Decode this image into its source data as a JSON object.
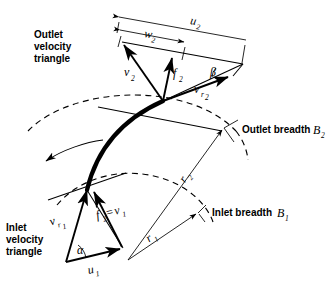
{
  "figure": {
    "kind": "centrifugal-impeller-velocity-triangles",
    "background_color": "#ffffff",
    "ink_color": "#000000"
  },
  "annotations": {
    "outlet_triangle_caption": [
      "Outlet",
      "velocity",
      "triangle"
    ],
    "inlet_triangle_caption": [
      "Inlet",
      "velocity",
      "triangle"
    ],
    "outlet_breadth": "Outlet breadth",
    "outlet_breadth_symbol": "B",
    "outlet_breadth_sub": "2",
    "inlet_breadth": "Inlet breadth",
    "inlet_breadth_symbol": "B",
    "inlet_breadth_sub": "1"
  },
  "vectors": {
    "outlet": [
      {
        "id": "u2",
        "symbol": "u",
        "sub": "2",
        "meaning": "blade-tip-speed"
      },
      {
        "id": "w2",
        "symbol": "w",
        "sub": "2",
        "meaning": "whirl-component"
      },
      {
        "id": "v2",
        "symbol": "v",
        "sub": "2",
        "meaning": "absolute-velocity"
      },
      {
        "id": "f2",
        "symbol": "f",
        "sub": "2",
        "meaning": "flow-component"
      },
      {
        "id": "vr2",
        "symbol": "v",
        "sub": "r2",
        "sub_main": "r",
        "sub_sub": "2",
        "meaning": "relative-velocity"
      }
    ],
    "inlet": [
      {
        "id": "u1",
        "symbol": "u",
        "sub": "1",
        "meaning": "blade-speed"
      },
      {
        "id": "vr1",
        "symbol": "v",
        "sub": "r1",
        "sub_main": "r",
        "sub_sub": "1",
        "meaning": "relative-velocity"
      },
      {
        "id": "f1v1",
        "symbol": "f",
        "sub": "2",
        "equals": "=",
        "symbol2": "v",
        "sub2": "1",
        "meaning": "flow-equals-absolute"
      }
    ]
  },
  "angles": {
    "beta": {
      "glyph": "β",
      "location": "outlet",
      "meaning": "blade-outlet-angle"
    },
    "alpha": {
      "glyph": "α",
      "location": "inlet",
      "meaning": "absolute-inlet-angle"
    }
  },
  "radii": [
    {
      "id": "r2",
      "symbol": "r",
      "sub": "2",
      "meaning": "outlet-radius"
    },
    {
      "id": "r1",
      "symbol": "r",
      "sub": "1",
      "meaning": "inlet-radius"
    }
  ],
  "rotation": {
    "arrow": "curved-arrow",
    "direction": "counter-clockwise"
  }
}
